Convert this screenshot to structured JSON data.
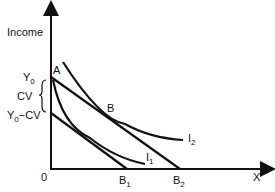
{
  "diagram": {
    "axes": {
      "y_label": "Income",
      "x_label": "X",
      "origin_label": "0"
    },
    "y_axis_ticks": [
      {
        "label": "Y",
        "sub": "0",
        "meaning": "Y0"
      },
      {
        "label": "CV",
        "sub": "",
        "meaning": "CV"
      },
      {
        "label": "Y",
        "sub": "0",
        "suffix": "−CV",
        "meaning": "Y0-CV"
      }
    ],
    "points": [
      {
        "label": "A"
      },
      {
        "label": "B"
      }
    ],
    "budget_lines": [
      {
        "label": "B",
        "sub": "1"
      },
      {
        "label": "B",
        "sub": "2"
      }
    ],
    "indifference_curves": [
      {
        "label": "I",
        "sub": "1"
      },
      {
        "label": "I",
        "sub": "2"
      }
    ],
    "colors": {
      "line": "#111111",
      "background": "#ffffff"
    }
  }
}
